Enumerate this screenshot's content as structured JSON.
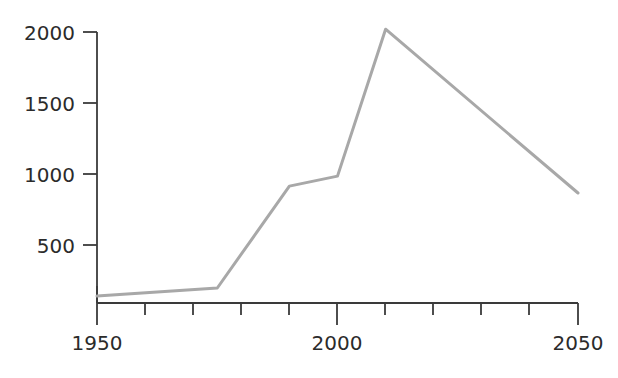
{
  "chart_data": {
    "type": "line",
    "title": "",
    "subtitle": "",
    "xlabel": "",
    "ylabel": "",
    "x": [
      1950,
      1975,
      1990,
      2000,
      2010,
      2050
    ],
    "values": [
      140,
      197,
      915,
      985,
      2020,
      866
    ],
    "series": [
      {
        "name": "",
        "x": [
          1950,
          1975,
          1990,
          2000,
          2010,
          2050
        ],
        "values": [
          140,
          197,
          915,
          985,
          2020,
          866
        ]
      }
    ],
    "xlim": [
      1950,
      2050
    ],
    "ylim": [
      0,
      2100
    ],
    "grid": false,
    "legend": null,
    "legend_position": "none",
    "line_color": "#a8a8a8",
    "line_width": 3,
    "axis_color": "#3a3a3a",
    "text_color": "#2b2b2b",
    "y_ticks": [
      500,
      1000,
      1500,
      2000
    ],
    "y_tick_labels": [
      "500",
      "1000",
      "1500",
      "2000"
    ],
    "x_ticks": [
      1950,
      1960,
      1970,
      1980,
      1990,
      2000,
      2010,
      2020,
      2030,
      2040,
      2050
    ],
    "x_tick_labels_shown": [
      "1950",
      "2000",
      "2050"
    ],
    "x_major_ticks": [
      1950,
      2000,
      2050
    ],
    "annotations": []
  },
  "axes": {
    "y_label_2000": "2000",
    "y_label_1500": "1500",
    "y_label_1000": "1000",
    "y_label_500": "500",
    "x_label_1950": "1950",
    "x_label_2000": "2000",
    "x_label_2050": "2050"
  }
}
